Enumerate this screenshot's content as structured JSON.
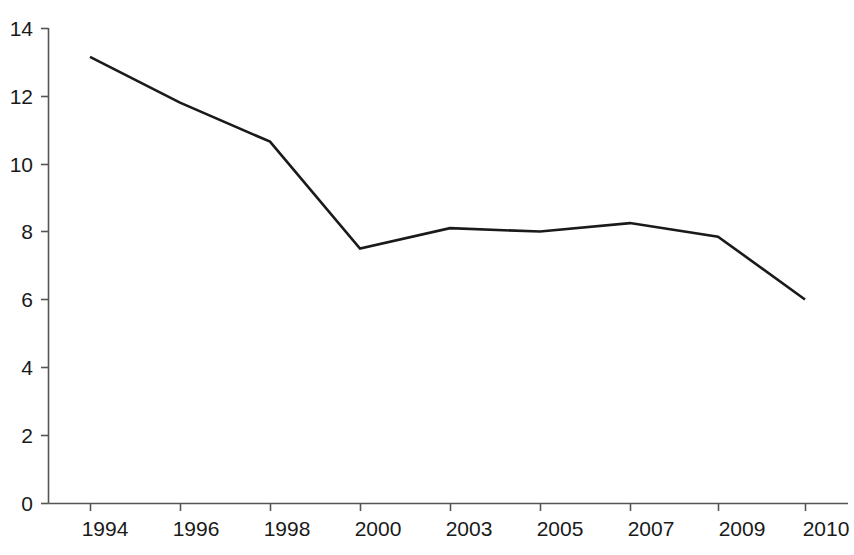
{
  "chart_data": {
    "type": "line",
    "title": "",
    "subtitle": "",
    "xlabel": "",
    "ylabel": "",
    "categories": [
      "1994",
      "1996",
      "1998",
      "2000",
      "2003",
      "2005",
      "2007",
      "2009",
      "2010"
    ],
    "series": [
      {
        "name": "",
        "color": "#1a1a1a",
        "values": [
          13.15,
          11.8,
          10.65,
          7.5,
          8.1,
          8.0,
          8.25,
          7.85,
          6.0
        ]
      }
    ],
    "values": [
      13.15,
      11.8,
      10.65,
      7.5,
      8.1,
      8.0,
      8.25,
      7.85,
      6.0
    ],
    "ylim": [
      0,
      14
    ],
    "yticks": [
      0,
      2,
      4,
      6,
      8,
      10,
      12,
      14
    ],
    "ytick_labels": [
      "0",
      "2",
      "4",
      "6",
      "8",
      "10",
      "12",
      "14"
    ],
    "xtick_labels": [
      "1994",
      "1996",
      "1998",
      "2000",
      "2003",
      "2005",
      "2007",
      "2009",
      "2010"
    ],
    "grid": false,
    "legend": false,
    "legend_position": "none",
    "annotations": [],
    "line_color": "#1a1a1a",
    "axis_color": "#555555",
    "background_color": "#ffffff"
  },
  "geometry": {
    "plot_left": 48,
    "plot_right": 840,
    "plot_top": 28,
    "plot_bottom": 503,
    "x_positions": [
      90,
      180,
      270,
      360,
      450,
      540,
      630,
      718,
      805
    ],
    "y_tick_positions": [
      503,
      435,
      367,
      299,
      231,
      164,
      96,
      28
    ]
  }
}
